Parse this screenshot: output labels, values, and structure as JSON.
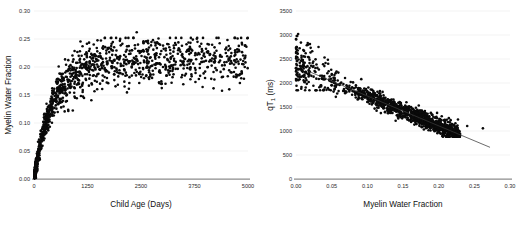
{
  "figure": {
    "title": "",
    "panel_count": 2
  },
  "chart_data": [
    {
      "type": "scatter",
      "panel": "left",
      "title": "",
      "xlabel": "Child Age (Days)",
      "ylabel": "Myelin Water Fraction",
      "xlim": [
        0,
        5000
      ],
      "ylim": [
        0.0,
        0.3
      ],
      "xticks": [
        0,
        1250,
        2500,
        3750,
        5000
      ],
      "xtick_labels": [
        "0",
        "1250",
        "2500",
        "3750",
        "5000"
      ],
      "yticks": [
        0.0,
        0.05,
        0.1,
        0.15,
        0.2,
        0.25,
        0.3
      ],
      "ytick_labels": [
        "0.00",
        "0.05",
        "0.10",
        "0.15",
        "0.20",
        "0.25",
        "0.30"
      ],
      "grid": true,
      "grid_axis": "y",
      "legend": false,
      "marker_color": "#0a0a0a",
      "marker_size": 1.3,
      "n_points": 1250,
      "description": "Myelin water fraction rises steeply from near 0 in the first ~500 days then plateaus near 0.20-0.22 by ~2000 days",
      "trend": {
        "model": "saturating_exponential",
        "plateau": 0.212,
        "rate_days": 430,
        "visible_line": false
      },
      "outliers": [
        {
          "x": 2400,
          "y": 0.262
        },
        {
          "x": 2430,
          "y": 0.24
        },
        {
          "x": 4700,
          "y": 0.23
        },
        {
          "x": 4600,
          "y": 0.219
        }
      ]
    },
    {
      "type": "scatter",
      "panel": "right",
      "title": "",
      "xlabel": "Myelin Water Fraction",
      "ylabel": "qT₁ (ms)",
      "ylabel_base": "qT",
      "ylabel_sub": "1",
      "ylabel_unit": " (ms)",
      "xlim": [
        0.0,
        0.3
      ],
      "ylim": [
        0,
        3500
      ],
      "xticks": [
        0.0,
        0.05,
        0.1,
        0.15,
        0.2,
        0.25,
        0.3
      ],
      "xtick_labels": [
        "0.00",
        "0.05",
        "0.10",
        "0.15",
        "0.20",
        "0.25",
        "0.30"
      ],
      "yticks": [
        0,
        500,
        1000,
        1500,
        2000,
        2500,
        3000,
        3500
      ],
      "ytick_labels": [
        "0",
        "500",
        "1000",
        "1500",
        "2000",
        "2500",
        "3000",
        "3500"
      ],
      "grid": true,
      "grid_axis": "y",
      "legend": false,
      "marker_color": "#0a0a0a",
      "marker_size": 1.3,
      "n_points": 1250,
      "description": "qT1 decreases with increasing myelin water fraction; dense linear band with a fitted regression line",
      "trend": {
        "model": "linear",
        "visible_line": true,
        "x_start": 0.018,
        "y_start": 2240,
        "x_end": 0.272,
        "y_end": 660,
        "slope_per_unit": -6220,
        "intercept": 2352
      },
      "outliers": [
        {
          "x": 0.003,
          "y": 3020
        },
        {
          "x": 0.04,
          "y": 2530
        },
        {
          "x": 0.262,
          "y": 1055
        },
        {
          "x": 0.24,
          "y": 1105
        }
      ]
    }
  ]
}
